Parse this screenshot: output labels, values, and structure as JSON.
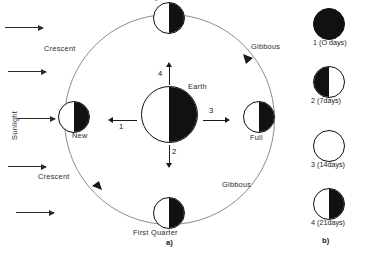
{
  "figure": {
    "panel_a_label": "a)",
    "panel_b_label": "b)"
  },
  "sunlight": {
    "label": "Sunlight",
    "ray_count": 5,
    "direction": "left-to-right",
    "arrow_icon": "arrow-right-icon"
  },
  "orbit_diagram": {
    "center_body": {
      "label": "Earth",
      "shading": "white-left-black-right"
    },
    "rotation_vectors": [
      {
        "num": "1",
        "direction": "left"
      },
      {
        "num": "2",
        "direction": "down"
      },
      {
        "num": "3",
        "direction": "right"
      },
      {
        "num": "4",
        "direction": "up"
      }
    ],
    "moon_positions": [
      {
        "label": "Last Quarter",
        "position": "top",
        "shading": "white-left-black-right"
      },
      {
        "label": "New",
        "position": "left",
        "shading": "white-left-black-right"
      },
      {
        "label": "Full",
        "position": "right",
        "shading": "white-left-black-right"
      },
      {
        "label": "First  Quarter",
        "position": "bottom",
        "shading": "white-left-black-right"
      }
    ],
    "region_labels": [
      {
        "label": "Crescent",
        "position": "upper-left"
      },
      {
        "label": "Crescent",
        "position": "lower-left"
      },
      {
        "label": "Gibbous",
        "position": "upper-right"
      },
      {
        "label": "Gibbous",
        "position": "lower-right"
      }
    ],
    "orbit_direction": "clockwise"
  },
  "phase_sequence": {
    "items": [
      {
        "num": "1",
        "caption": "1 (O days)",
        "appearance": "all-dark"
      },
      {
        "num": "2",
        "caption": "2 (7days)",
        "appearance": "dark-left-light-right"
      },
      {
        "num": "3",
        "caption": "3 (14days)",
        "appearance": "all-light"
      },
      {
        "num": "4",
        "caption": "4 (21days)",
        "appearance": "light-left-dark-right"
      }
    ]
  },
  "colors": {
    "ink": "#111111",
    "orbit_line": "#8d8d8d",
    "background": "#ffffff"
  }
}
